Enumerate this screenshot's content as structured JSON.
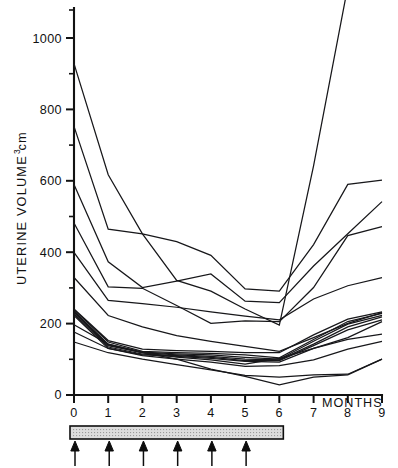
{
  "chart_data": {
    "type": "line",
    "title": "",
    "xlabel": "MONTHS",
    "ylabel": "UTERINE VOLUME cm",
    "ylabel_superscript": "3",
    "xlim": [
      0,
      9
    ],
    "ylim": [
      0,
      1100
    ],
    "grid": false,
    "legend": "none",
    "x_tick_labels": [
      "0",
      "1",
      "2",
      "3",
      "4",
      "5",
      "6",
      "7",
      "8",
      "9"
    ],
    "x_ticks": [
      0,
      1,
      2,
      3,
      4,
      5,
      6,
      7,
      8,
      9
    ],
    "y_tick_labels": [
      "0",
      "200",
      "400",
      "600",
      "800",
      "1000"
    ],
    "y_ticks": [
      0,
      200,
      400,
      600,
      800,
      1000
    ],
    "y_minor_ticks": [
      100,
      300,
      500,
      700,
      900,
      1100
    ],
    "line_color": "#17171a",
    "series": [
      {
        "name": "patient-1",
        "x": [
          0,
          1,
          2,
          3,
          4,
          5,
          6,
          7,
          8,
          9
        ],
        "values": [
          925,
          615,
          450,
          320,
          290,
          240,
          195,
          640,
          1140,
          1120
        ]
      },
      {
        "name": "patient-2",
        "x": [
          0,
          1,
          2,
          3,
          4,
          5,
          6,
          7,
          8,
          9
        ],
        "values": [
          750,
          463,
          450,
          428,
          390,
          296,
          290,
          420,
          588,
          600
        ]
      },
      {
        "name": "patient-3",
        "x": [
          0,
          1,
          2,
          3,
          4,
          5,
          6,
          7,
          8,
          9
        ],
        "values": [
          588,
          372,
          300,
          318,
          338,
          262,
          258,
          360,
          450,
          540
        ]
      },
      {
        "name": "patient-4",
        "x": [
          0,
          1,
          2,
          3,
          4,
          5,
          6,
          7,
          8,
          9
        ],
        "values": [
          480,
          302,
          298,
          250,
          200,
          207,
          205,
          300,
          445,
          470
        ]
      },
      {
        "name": "patient-5",
        "x": [
          0,
          1,
          2,
          3,
          4,
          5,
          6,
          7,
          8,
          9
        ],
        "values": [
          398,
          264,
          255,
          245,
          232,
          220,
          210,
          268,
          305,
          328
        ]
      },
      {
        "name": "patient-6",
        "x": [
          0,
          1,
          2,
          3,
          4,
          5,
          6,
          7,
          8,
          9
        ],
        "values": [
          328,
          222,
          190,
          166,
          150,
          136,
          122,
          160,
          200,
          230
        ]
      },
      {
        "name": "patient-7",
        "x": [
          0,
          1,
          2,
          3,
          4,
          5,
          6,
          7,
          8,
          9
        ],
        "values": [
          240,
          152,
          128,
          124,
          122,
          118,
          118,
          168,
          212,
          232
        ]
      },
      {
        "name": "patient-8",
        "x": [
          0,
          1,
          2,
          3,
          4,
          5,
          6,
          7,
          8,
          9
        ],
        "values": [
          238,
          148,
          122,
          118,
          116,
          112,
          104,
          155,
          205,
          228
        ]
      },
      {
        "name": "patient-9",
        "x": [
          0,
          1,
          2,
          3,
          4,
          5,
          6,
          7,
          8,
          9
        ],
        "values": [
          234,
          142,
          120,
          115,
          112,
          105,
          100,
          150,
          198,
          222
        ]
      },
      {
        "name": "patient-10",
        "x": [
          0,
          1,
          2,
          3,
          4,
          5,
          6,
          7,
          8,
          9
        ],
        "values": [
          230,
          138,
          118,
          112,
          108,
          100,
          98,
          142,
          190,
          218
        ]
      },
      {
        "name": "patient-11",
        "x": [
          0,
          1,
          2,
          3,
          4,
          5,
          6,
          7,
          8,
          9
        ],
        "values": [
          226,
          134,
          114,
          110,
          105,
          96,
          96,
          138,
          182,
          210
        ]
      },
      {
        "name": "patient-12",
        "x": [
          0,
          1,
          2,
          3,
          4,
          5,
          6,
          7,
          8,
          9
        ],
        "values": [
          222,
          130,
          112,
          108,
          102,
          94,
          92,
          130,
          160,
          205
        ]
      },
      {
        "name": "patient-13",
        "x": [
          0,
          1,
          2,
          3,
          4,
          5,
          6,
          7,
          8,
          9
        ],
        "values": [
          196,
          142,
          118,
          106,
          98,
          86,
          102,
          130,
          155,
          170
        ]
      },
      {
        "name": "patient-14",
        "x": [
          0,
          1,
          2,
          3,
          4,
          5,
          6,
          7,
          8,
          9
        ],
        "values": [
          176,
          130,
          110,
          100,
          92,
          80,
          82,
          98,
          128,
          150
        ]
      },
      {
        "name": "patient-15",
        "x": [
          0,
          1,
          2,
          3,
          4,
          5,
          6,
          7,
          8,
          9
        ],
        "values": [
          148,
          118,
          100,
          85,
          70,
          55,
          50,
          56,
          58,
          100
        ]
      },
      {
        "name": "patient-16",
        "x": [
          0,
          1,
          2,
          3,
          4,
          5,
          6,
          7,
          8,
          9
        ],
        "values": [
          232,
          140,
          118,
          100,
          72,
          52,
          28,
          50,
          56,
          100
        ]
      }
    ],
    "annotations": {
      "treatment_bar": {
        "label": "treatment-period-bar",
        "x_start": 0,
        "x_end": 6,
        "fill": "#dcdcdc",
        "stroke": "#0e0e0e"
      },
      "injection_arrows": {
        "label": "injection-arrows",
        "x_positions": [
          0,
          1,
          2,
          3,
          4,
          5
        ],
        "color": "#0d0d0d",
        "direction": "up"
      }
    }
  },
  "axes": {
    "y_axis_name": "uterine-volume-axis",
    "x_axis_name": "months-axis"
  }
}
